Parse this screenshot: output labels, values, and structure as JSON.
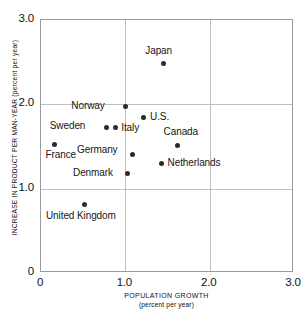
{
  "chart_data": {
    "type": "scatter",
    "title": "",
    "xlabel": "POPULATION GROWTH",
    "xlabel_sub": "(percent per year)",
    "ylabel": "INCREASE IN PRODUCT PER MAN-YEAR (percent per year)",
    "xlim": [
      0,
      3.0
    ],
    "ylim": [
      0,
      3.0
    ],
    "xticks": [
      "0",
      "1.0",
      "2.0",
      "3.0"
    ],
    "xtick_values": [
      0,
      1.0,
      2.0,
      3.0
    ],
    "yticks": [
      "0",
      "1.0",
      "2.0",
      "3.0"
    ],
    "ytick_values": [
      0,
      1.0,
      2.0,
      3.0
    ],
    "grid": true,
    "legend": "none",
    "points": [
      {
        "label": "Japan",
        "x": 1.45,
        "y": 2.48,
        "label_dx": -18,
        "label_dy": -19
      },
      {
        "label": "Norway",
        "x": 1.0,
        "y": 1.97,
        "label_dx": -54,
        "label_dy": -7
      },
      {
        "label": "U.S.",
        "x": 1.21,
        "y": 1.84,
        "label_dx": 7,
        "label_dy": -7
      },
      {
        "label": "Sweden",
        "x": 0.78,
        "y": 1.73,
        "label_dx": -57,
        "label_dy": -7
      },
      {
        "label": "Italy",
        "x": 0.88,
        "y": 1.73,
        "label_dx": 6,
        "label_dy": -5
      },
      {
        "label": "Canada",
        "x": 1.62,
        "y": 1.51,
        "label_dx": -14,
        "label_dy": -20
      },
      {
        "label": "France",
        "x": 0.16,
        "y": 1.52,
        "label_dx": -9,
        "label_dy": 4
      },
      {
        "label": "Germany",
        "x": 1.08,
        "y": 1.4,
        "label_dx": -55,
        "label_dy": -11
      },
      {
        "label": "Netherlands",
        "x": 1.43,
        "y": 1.3,
        "label_dx": 6,
        "label_dy": -6
      },
      {
        "label": "Denmark",
        "x": 1.02,
        "y": 1.18,
        "label_dx": -54,
        "label_dy": -6
      },
      {
        "label": "United Kingdom",
        "x": 0.51,
        "y": 0.81,
        "label_dx": -38,
        "label_dy": 5
      }
    ]
  }
}
